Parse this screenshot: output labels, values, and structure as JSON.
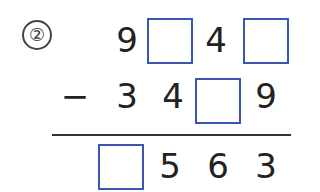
{
  "problem": {
    "number": "②",
    "operator": "−",
    "minuend": [
      "9",
      "",
      "4",
      ""
    ],
    "subtrahend": [
      "3",
      "4",
      "",
      "9"
    ],
    "difference": [
      "",
      "5",
      "6",
      "3"
    ],
    "box_color": "#3a55b4"
  }
}
